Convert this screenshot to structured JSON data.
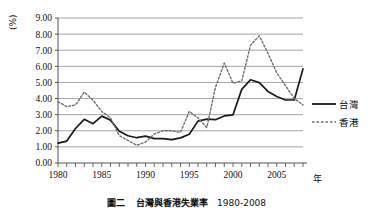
{
  "figure": {
    "caption_number": "圖二",
    "caption_title": "台灣與香港失業率",
    "caption_range": "1980-2008"
  },
  "chart_data": {
    "type": "line",
    "title": "",
    "xlabel": "年",
    "ylabel": "(%)",
    "ylim": [
      0,
      9
    ],
    "xlim": [
      1980,
      2008
    ],
    "ytick_labels": [
      "0.00",
      "1.00",
      "2.00",
      "3.00",
      "4.00",
      "5.00",
      "6.00",
      "7.00",
      "8.00",
      "9.00"
    ],
    "ytick_values": [
      0,
      1,
      2,
      3,
      4,
      5,
      6,
      7,
      8,
      9
    ],
    "xtick_labels": [
      "1980",
      "1985",
      "1990",
      "1995",
      "2000",
      "2005"
    ],
    "xtick_values": [
      1980,
      1985,
      1990,
      1995,
      2000,
      2005
    ],
    "grid": "horizontal",
    "legend_position": "right",
    "x": [
      1980,
      1981,
      1982,
      1983,
      1984,
      1985,
      1986,
      1987,
      1988,
      1989,
      1990,
      1991,
      1992,
      1993,
      1994,
      1995,
      1996,
      1997,
      1998,
      1999,
      2000,
      2001,
      2002,
      2003,
      2004,
      2005,
      2006,
      2007,
      2008
    ],
    "series": [
      {
        "name": "台灣",
        "style": "solid",
        "color": "#1a1a1a",
        "values": [
          1.23,
          1.36,
          2.14,
          2.71,
          2.44,
          2.91,
          2.66,
          1.97,
          1.69,
          1.57,
          1.67,
          1.51,
          1.51,
          1.45,
          1.56,
          1.79,
          2.6,
          2.72,
          2.69,
          2.92,
          2.99,
          4.57,
          5.17,
          4.99,
          4.44,
          4.13,
          3.91,
          3.91,
          5.85
        ]
      },
      {
        "name": "香港",
        "style": "dotted",
        "color": "#6e6e6e",
        "values": [
          3.8,
          3.5,
          3.6,
          4.4,
          3.9,
          3.2,
          2.8,
          1.7,
          1.4,
          1.1,
          1.3,
          1.8,
          2.0,
          2.0,
          1.9,
          3.2,
          2.8,
          2.2,
          4.7,
          6.2,
          4.95,
          5.1,
          7.3,
          7.9,
          6.8,
          5.6,
          4.8,
          4.0,
          3.6
        ]
      }
    ]
  },
  "legend": {
    "items": [
      {
        "label": "台灣",
        "style": "solid"
      },
      {
        "label": "香港",
        "style": "dotted"
      }
    ]
  }
}
